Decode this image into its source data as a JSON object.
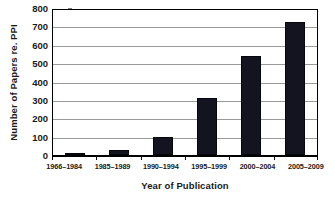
{
  "chart_data": {
    "type": "bar",
    "title": "",
    "xlabel": "Year of Publication",
    "ylabel": "Number of Papers re. PPI",
    "categories": [
      "1966–1984",
      "1985–1989",
      "1990–1994",
      "1995–1999",
      "2000–2004",
      "2005–2009"
    ],
    "values": [
      8,
      25,
      98,
      313,
      540,
      725
    ],
    "ylim": [
      0,
      800
    ],
    "ytick_step": 100,
    "yticks": [
      0,
      100,
      200,
      300,
      400,
      500,
      600,
      700,
      800
    ],
    "ytick_labels": [
      "0",
      "100",
      "200",
      "300",
      "400",
      "500",
      "600",
      "700",
      "800"
    ],
    "grid": true,
    "grid_axis": "y",
    "legend": false,
    "legend_position": "none",
    "bar_color": "#141420",
    "grid_color": "#9a9a9a",
    "axis_color": "#000000",
    "background_color": "#ffffff",
    "series": [
      {
        "name": "Number of Papers re. PPI",
        "values": [
          8,
          25,
          98,
          313,
          540,
          725
        ]
      }
    ]
  }
}
